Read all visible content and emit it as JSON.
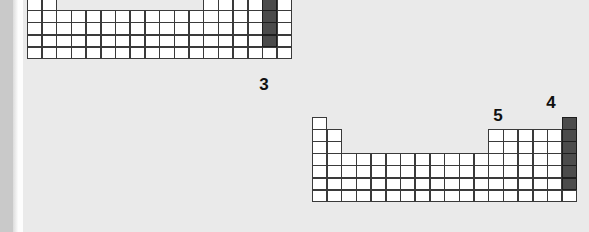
{
  "figure": {
    "background_color": "#eaeaea",
    "cell_fill_color": "#ffffff",
    "cell_highlight_color": "#4b4b4b",
    "cell_border_color": "#3a3a3a",
    "label_color": "#101010"
  },
  "tables": [
    {
      "id": "upper-periodic-table",
      "name": "Periodic table diagram (upper)",
      "origin_x": 27,
      "origin_y": -26,
      "cell_width": 14.7,
      "cell_height": 12.1,
      "columns": 18,
      "rows": 7,
      "clipped_top": true,
      "highlight_label": "3",
      "highlighted_cells": [
        {
          "col": 17,
          "row": 1
        },
        {
          "col": 17,
          "row": 2
        },
        {
          "col": 17,
          "row": 3
        },
        {
          "col": 17,
          "row": 4
        },
        {
          "col": 17,
          "row": 5
        },
        {
          "col": 17,
          "row": 6
        }
      ],
      "label_position": {
        "x": 255,
        "y": 76
      }
    },
    {
      "id": "lower-periodic-table",
      "name": "Periodic table diagram (lower)",
      "origin_x": 312,
      "origin_y": 117,
      "cell_width": 14.7,
      "cell_height": 12.1,
      "columns": 18,
      "rows": 7,
      "clipped_top": false,
      "highlight_labels": [
        "5",
        "4"
      ],
      "highlighted_cells": [
        {
          "col": 14,
          "row": 1
        },
        {
          "col": 18,
          "row": 1
        },
        {
          "col": 18,
          "row": 2
        },
        {
          "col": 18,
          "row": 3
        },
        {
          "col": 18,
          "row": 4
        },
        {
          "col": 18,
          "row": 5
        },
        {
          "col": 18,
          "row": 6
        }
      ]
    }
  ],
  "labels": [
    {
      "id": "label-3",
      "text": "3",
      "x": 253,
      "y": 76,
      "refers_to": "upper-table-column-17"
    },
    {
      "id": "label-5",
      "text": "5",
      "x": 487,
      "y": 107,
      "refers_to": "lower-table-column-14-row-1"
    },
    {
      "id": "label-4",
      "text": "4",
      "x": 540,
      "y": 94,
      "refers_to": "lower-table-column-18"
    }
  ]
}
